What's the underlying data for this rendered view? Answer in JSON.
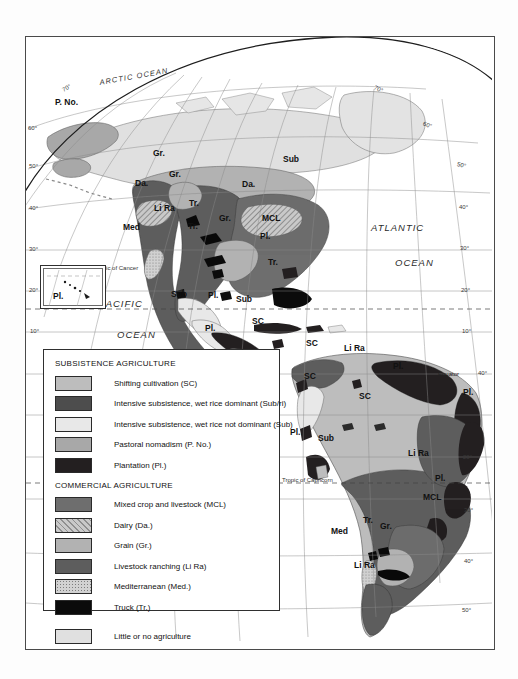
{
  "map": {
    "title": "World agriculture regions map — Americas",
    "frame": {
      "border_color": "#4a4a4a"
    },
    "oceans": [
      {
        "name": "arctic-ocean",
        "text": "ARCTIC OCEAN",
        "x": 98,
        "y": 72
      },
      {
        "name": "atlantic-ocean-word1",
        "text": "ATLANTIC",
        "x": 370,
        "y": 228
      },
      {
        "name": "atlantic-ocean-word2",
        "text": "OCEAN",
        "x": 394,
        "y": 262
      },
      {
        "name": "pacific-ocean-word1",
        "text": "PACIFIC",
        "x": 98,
        "y": 303
      },
      {
        "name": "pacific-ocean-word2",
        "text": "OCEAN",
        "x": 116,
        "y": 334
      }
    ],
    "reference_lines": [
      {
        "name": "tropic-of-cancer",
        "text": "Tropic of Cancer",
        "x": 93,
        "y": 271
      },
      {
        "name": "tropic-of-capricorn",
        "text": "Tropic of Capricorn",
        "x": 281,
        "y": 481
      },
      {
        "name": "equator",
        "text": "Equator",
        "x": 437,
        "y": 375
      }
    ],
    "lat_labels_left": [
      {
        "text": "70°",
        "x": 61,
        "y": 90
      },
      {
        "text": "60°",
        "x": 26,
        "y": 129
      },
      {
        "text": "50°",
        "x": 27,
        "y": 167
      },
      {
        "text": "40°",
        "x": 28,
        "y": 209
      },
      {
        "text": "30°",
        "x": 28,
        "y": 250
      },
      {
        "text": "20°",
        "x": 28,
        "y": 291
      },
      {
        "text": "10°",
        "x": 29,
        "y": 332
      }
    ],
    "lat_labels_right": [
      {
        "text": "70°",
        "x": 373,
        "y": 91
      },
      {
        "text": "60°",
        "x": 422,
        "y": 127
      },
      {
        "text": "50°",
        "x": 456,
        "y": 167
      },
      {
        "text": "50°",
        "x": 457,
        "y": 167
      },
      {
        "text": "40°",
        "x": 458,
        "y": 208
      },
      {
        "text": "30°",
        "x": 459,
        "y": 250
      },
      {
        "text": "20°",
        "x": 460,
        "y": 291
      },
      {
        "text": "10°",
        "x": 461,
        "y": 333
      },
      {
        "text": "40°",
        "x": 478,
        "y": 374
      },
      {
        "text": "20°",
        "x": 463,
        "y": 458
      },
      {
        "text": "30°",
        "x": 464,
        "y": 512
      },
      {
        "text": "40°",
        "x": 464,
        "y": 563
      },
      {
        "text": "50°",
        "x": 462,
        "y": 612
      }
    ],
    "region_labels": [
      {
        "text": "P. No.",
        "x": 54,
        "y": 104
      },
      {
        "text": "Gr.",
        "x": 152,
        "y": 155
      },
      {
        "text": "Gr.",
        "x": 168,
        "y": 176
      },
      {
        "text": "Da.",
        "x": 134,
        "y": 185
      },
      {
        "text": "Da.",
        "x": 241,
        "y": 186
      },
      {
        "text": "Sub",
        "x": 282,
        "y": 161
      },
      {
        "text": "Li Ra",
        "x": 155,
        "y": 210
      },
      {
        "text": "Tr.",
        "x": 186,
        "y": 205
      },
      {
        "text": "Tr.",
        "x": 185,
        "y": 228
      },
      {
        "text": "Gr.",
        "x": 217,
        "y": 220
      },
      {
        "text": "Med",
        "x": 123,
        "y": 229
      },
      {
        "text": "MCL",
        "x": 262,
        "y": 220
      },
      {
        "text": "Pl.",
        "x": 258,
        "y": 238
      },
      {
        "text": "Tr.",
        "x": 266,
        "y": 264
      },
      {
        "text": "Sub",
        "x": 170,
        "y": 296
      },
      {
        "text": "Pl.",
        "x": 206,
        "y": 297
      },
      {
        "text": "Sub",
        "x": 235,
        "y": 301
      },
      {
        "text": "SC",
        "x": 250,
        "y": 323
      },
      {
        "text": "Pl.",
        "x": 203,
        "y": 330
      },
      {
        "text": "SC",
        "x": 304,
        "y": 345
      },
      {
        "text": "Li Ra",
        "x": 345,
        "y": 350
      },
      {
        "text": "Pl.",
        "x": 390,
        "y": 368
      },
      {
        "text": "SC",
        "x": 302,
        "y": 378
      },
      {
        "text": "SC",
        "x": 358,
        "y": 398
      },
      {
        "text": "Pl.",
        "x": 460,
        "y": 394
      },
      {
        "text": "Pl.",
        "x": 288,
        "y": 434
      },
      {
        "text": "Sub",
        "x": 317,
        "y": 440
      },
      {
        "text": "Li Ra",
        "x": 409,
        "y": 455
      },
      {
        "text": "Pl.",
        "x": 432,
        "y": 480
      },
      {
        "text": "MCL",
        "x": 424,
        "y": 499
      },
      {
        "text": "Gr.",
        "x": 378,
        "y": 528
      },
      {
        "text": "Tr.",
        "x": 361,
        "y": 522
      },
      {
        "text": "Med",
        "x": 331,
        "y": 533
      },
      {
        "text": "Li Ra",
        "x": 355,
        "y": 567
      }
    ],
    "hawaii_inset": {
      "label": "Pl."
    }
  },
  "legend": {
    "heading_subsistence": "SUBSISTENCE AGRICULTURE",
    "heading_commercial": "COMMERCIAL AGRICULTURE",
    "subsistence_items": [
      {
        "label": "Shifting cultivation (SC)",
        "fill": "f-sc",
        "color": "#bdbdbd",
        "name": "shifting-cultivation"
      },
      {
        "label": "Intensive subsistence, wet rice dominant (Sub/ri)",
        "fill": "f-subri",
        "color": "#4d4d4d",
        "name": "intensive-subsistence-wet-rice-dominant"
      },
      {
        "label": "Intensive subsistence, wet rice not dominant (Sub)",
        "fill": "f-sub",
        "color": "#e8e8e8",
        "name": "intensive-subsistence-wet-rice-not-dominant"
      },
      {
        "label": "Pastoral nomadism (P. No.)",
        "fill": "f-pno",
        "color": "#a8a8a8",
        "name": "pastoral-nomadism"
      },
      {
        "label": "Plantation (Pl.)",
        "fill": "f-pl",
        "color": "#231f20",
        "name": "plantation"
      }
    ],
    "commercial_items": [
      {
        "label": "Mixed crop and livestock (MCL)",
        "fill": "f-mcl",
        "color": "#6e6e6e",
        "name": "mixed-crop-and-livestock"
      },
      {
        "label": "Dairy (Da.)",
        "fill": "f-da",
        "color": "#c9c9c9",
        "name": "dairy"
      },
      {
        "label": "Grain (Gr.)",
        "fill": "f-gr",
        "color": "#b2b2b2",
        "name": "grain"
      },
      {
        "label": "Livestock ranching (Li Ra)",
        "fill": "f-lira",
        "color": "#5d5d5d",
        "name": "livestock-ranching"
      },
      {
        "label": "Mediterranean (Med.)",
        "fill": "f-med",
        "color": "#d2d2d2",
        "name": "mediterranean"
      },
      {
        "label": "Truck (Tr.)",
        "fill": "f-tr",
        "color": "#0b0b0b",
        "name": "truck"
      }
    ],
    "other_item": {
      "label": "Little or no agriculture",
      "fill": "f-none",
      "color": "#e0e0e0",
      "name": "little-or-no-agriculture"
    }
  }
}
